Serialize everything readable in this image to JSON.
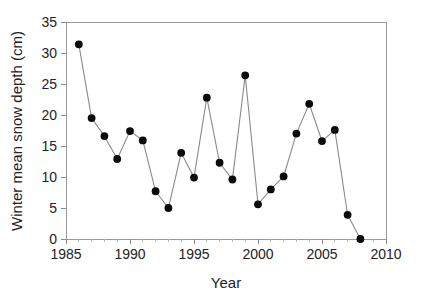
{
  "chart_data": {
    "type": "line",
    "title": "",
    "xlabel": "Year",
    "ylabel": "Winter mean snow depth (cm)",
    "xlim": [
      1985,
      2010
    ],
    "ylim": [
      0,
      35
    ],
    "grid": false,
    "legend": "none",
    "x_major_ticks": [
      1985,
      1990,
      1995,
      2000,
      2005,
      2010
    ],
    "x_tick_labels": [
      "1985",
      "1990",
      "1995",
      "2000",
      "2005",
      "2010"
    ],
    "x_minor_tick_interval": 1,
    "y_major_ticks": [
      0,
      5,
      10,
      15,
      20,
      25,
      30,
      35
    ],
    "y_tick_labels": [
      "0",
      "5",
      "10",
      "15",
      "20",
      "25",
      "30",
      "35"
    ],
    "marker": "filled-circle",
    "marker_color": "#0b0b0b",
    "line_color": "#8a8a8a",
    "background_color": "#ffffff",
    "x": [
      1986,
      1987,
      1988,
      1989,
      1990,
      1991,
      1992,
      1993,
      1994,
      1995,
      1996,
      1997,
      1998,
      1999,
      2000,
      2001,
      2002,
      2003,
      2004,
      2005,
      2006,
      2007,
      2008
    ],
    "values": [
      31.4,
      19.5,
      16.6,
      12.9,
      17.4,
      15.9,
      7.7,
      5.0,
      13.9,
      9.9,
      22.8,
      12.3,
      9.6,
      26.4,
      5.6,
      8.0,
      10.1,
      17.0,
      21.8,
      15.8,
      17.6,
      3.9,
      0.0
    ],
    "series": [
      {
        "name": "Winter mean snow depth",
        "values": [
          31.4,
          19.5,
          16.6,
          12.9,
          17.4,
          15.9,
          7.7,
          5.0,
          13.9,
          9.9,
          22.8,
          12.3,
          9.6,
          26.4,
          5.6,
          8.0,
          10.1,
          17.0,
          21.8,
          15.8,
          17.6,
          3.9,
          0.0
        ]
      }
    ]
  }
}
